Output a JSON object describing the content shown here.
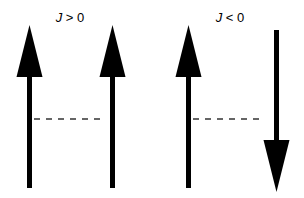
{
  "diagram": {
    "panels": [
      {
        "label_var": "J",
        "label_rel": " > 0",
        "spins": [
          "up",
          "up"
        ],
        "coupling": "dashed"
      },
      {
        "label_var": "J",
        "label_rel": " < 0",
        "spins": [
          "up",
          "down"
        ],
        "coupling": "dashed"
      }
    ],
    "colors": {
      "arrow": "#000000",
      "dash": "#333333",
      "background": "#ffffff"
    }
  }
}
